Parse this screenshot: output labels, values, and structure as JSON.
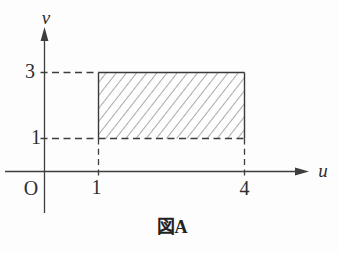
{
  "figure": {
    "caption": "図A",
    "labels": {
      "v_axis": "v",
      "u_axis": "u",
      "origin": "O"
    },
    "ticks": {
      "v": [
        {
          "value": "3"
        },
        {
          "value": "1"
        }
      ],
      "u": [
        {
          "value": "1"
        },
        {
          "value": "4"
        }
      ]
    },
    "region": {
      "u_min": 1,
      "u_max": 4,
      "v_min": 1,
      "v_max": 3,
      "fill_style": "diagonal-hatch"
    },
    "colors": {
      "line": "#3e3e3e",
      "hatch": "#5a5a5a",
      "text": "#2e2e2e",
      "background": "#fdfdfd"
    }
  }
}
